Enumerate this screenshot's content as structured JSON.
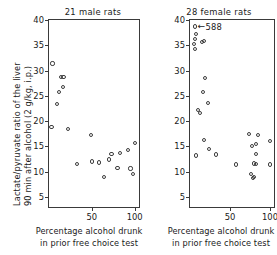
{
  "figure": {
    "ylabel_line1": "Lactate/pyruvate ratio of the liver",
    "ylabel_line2": "90 min after alcohol (2 g/kg, i.p.)",
    "xlabel_line1": "Percentage alcohol drunk",
    "xlabel_line2": "in prior free choice test",
    "marker_color": "#3d3d3d",
    "axis_color": "#3a3a3a",
    "background": "#ffffff"
  },
  "chart_data": {
    "type": "scatter",
    "title": "",
    "xlabel": "Percentage alcohol drunk in prior free choice test",
    "ylabel": "Lactate/pyruvate ratio of the liver 90 min after alcohol (2 g/kg, i.p.)",
    "xlim": [
      0,
      105
    ],
    "ylim": [
      3,
      40
    ],
    "xticks": [
      50,
      100
    ],
    "xticklabels": [
      "50",
      "100"
    ],
    "yticks": [
      5,
      10,
      15,
      20,
      25,
      30,
      35,
      40
    ],
    "yticklabels": [
      "5",
      "10",
      "15",
      "20",
      "25",
      "30",
      "35",
      "40"
    ],
    "grid": false,
    "legend": "none",
    "panels": [
      {
        "id": "male",
        "title": "21 male rats",
        "n": 21,
        "annotations": [],
        "points": [
          {
            "x": 4,
            "y": 31.4
          },
          {
            "x": 3,
            "y": 18.9
          },
          {
            "x": 9,
            "y": 23.4
          },
          {
            "x": 12,
            "y": 25.8
          },
          {
            "x": 14,
            "y": 28.8
          },
          {
            "x": 17,
            "y": 28.8
          },
          {
            "x": 16,
            "y": 26.7
          },
          {
            "x": 22,
            "y": 18.4
          },
          {
            "x": 33,
            "y": 11.5
          },
          {
            "x": 49,
            "y": 17.3
          },
          {
            "x": 50,
            "y": 12.0
          },
          {
            "x": 58,
            "y": 11.8
          },
          {
            "x": 64,
            "y": 8.9
          },
          {
            "x": 70,
            "y": 12.4
          },
          {
            "x": 73,
            "y": 13.5
          },
          {
            "x": 80,
            "y": 10.7
          },
          {
            "x": 83,
            "y": 13.7
          },
          {
            "x": 92,
            "y": 14.2
          },
          {
            "x": 95,
            "y": 10.6
          },
          {
            "x": 98,
            "y": 9.6
          },
          {
            "x": 100,
            "y": 15.7
          }
        ]
      },
      {
        "id": "female",
        "title": "28 female rats",
        "n": 28,
        "annotations": [
          {
            "text": "588",
            "x": 8,
            "y": 38.7,
            "arrow": "left"
          }
        ],
        "points": [
          {
            "x": 6,
            "y": 38.7
          },
          {
            "x": 8,
            "y": 37.2
          },
          {
            "x": 6,
            "y": 36.3
          },
          {
            "x": 5,
            "y": 35.3
          },
          {
            "x": 6,
            "y": 34.3
          },
          {
            "x": 15,
            "y": 35.6
          },
          {
            "x": 17,
            "y": 35.8
          },
          {
            "x": 19,
            "y": 28.5
          },
          {
            "x": 16,
            "y": 25.7
          },
          {
            "x": 22,
            "y": 23.6
          },
          {
            "x": 10,
            "y": 22.2
          },
          {
            "x": 13,
            "y": 21.6
          },
          {
            "x": 18,
            "y": 16.2
          },
          {
            "x": 24,
            "y": 14.5
          },
          {
            "x": 7,
            "y": 13.2
          },
          {
            "x": 33,
            "y": 13.4
          },
          {
            "x": 58,
            "y": 11.4
          },
          {
            "x": 74,
            "y": 17.5
          },
          {
            "x": 85,
            "y": 17.2
          },
          {
            "x": 77,
            "y": 15.1
          },
          {
            "x": 82,
            "y": 15.5
          },
          {
            "x": 82,
            "y": 13.5
          },
          {
            "x": 80,
            "y": 11.6
          },
          {
            "x": 82,
            "y": 11.5
          },
          {
            "x": 76,
            "y": 9.5
          },
          {
            "x": 79,
            "y": 8.8
          },
          {
            "x": 80,
            "y": 9.0
          },
          {
            "x": 100,
            "y": 11.4
          },
          {
            "x": 100,
            "y": 16.0
          }
        ]
      }
    ]
  }
}
